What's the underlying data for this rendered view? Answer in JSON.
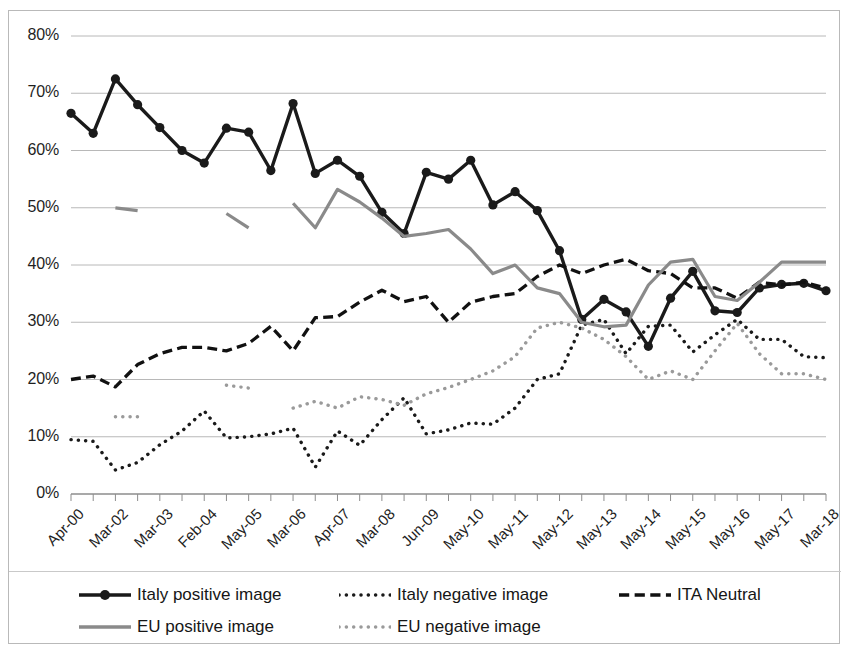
{
  "chart_data": {
    "type": "line",
    "title": "",
    "xlabel": "",
    "ylabel": "",
    "ylim": [
      0,
      80
    ],
    "yticks": [
      "0%",
      "10%",
      "20%",
      "30%",
      "40%",
      "50%",
      "60%",
      "70%",
      "80%"
    ],
    "ytick_values": [
      0,
      10,
      20,
      30,
      40,
      50,
      60,
      70,
      80
    ],
    "grid": true,
    "legend_position": "bottom",
    "categories": [
      "Apr-00",
      "Nov-00",
      "Mar-02",
      "Oct-02",
      "Mar-03",
      "Oct-03",
      "Feb-04",
      "Oct-04",
      "May-05",
      "Nov-05",
      "Mar-06",
      "Sep-06",
      "Apr-07",
      "Oct-07",
      "Mar-08",
      "Oct-08",
      "Jun-09",
      "Nov-09",
      "May-10",
      "Nov-10",
      "May-11",
      "Nov-11",
      "May-12",
      "Nov-12",
      "May-13",
      "Nov-13",
      "May-14",
      "Nov-14",
      "May-15",
      "Nov-15",
      "May-16",
      "Nov-16",
      "May-17",
      "Nov-17",
      "Mar-18"
    ],
    "xtick_labels": [
      "Apr-00",
      "Mar-02",
      "Mar-03",
      "Feb-04",
      "May-05",
      "Mar-06",
      "Apr-07",
      "Mar-08",
      "Jun-09",
      "May-10",
      "May-11",
      "May-12",
      "May-13",
      "May-14",
      "May-15",
      "May-16",
      "May-17",
      "Mar-18"
    ],
    "series": [
      {
        "name": "Italy positive image",
        "color": "#1a1a1a",
        "style": "solid",
        "markers": true,
        "values": [
          66.5,
          63.0,
          72.5,
          68.0,
          64.0,
          60.0,
          57.8,
          63.9,
          63.2,
          56.5,
          68.2,
          56.0,
          58.3,
          55.5,
          49.2,
          45.5,
          56.2,
          55.0,
          58.3,
          50.5,
          52.8,
          49.5,
          42.5,
          30.5,
          34.0,
          31.8,
          25.8,
          34.2,
          38.9,
          32.0,
          31.7,
          36.0,
          36.6,
          36.8,
          35.5
        ]
      },
      {
        "name": "Italy negative image",
        "color": "#1a1a1a",
        "style": "dotted",
        "markers": false,
        "values": [
          9.5,
          9.2,
          4.2,
          5.5,
          8.6,
          11.0,
          14.5,
          9.8,
          10.0,
          10.5,
          11.5,
          4.7,
          11.0,
          8.5,
          13.0,
          16.8,
          10.5,
          11.2,
          12.4,
          12.2,
          15.0,
          20.0,
          21.0,
          29.5,
          30.5,
          24.5,
          29.3,
          29.5,
          24.8,
          27.8,
          30.5,
          27.0,
          27.0,
          24.0,
          23.8
        ]
      },
      {
        "name": "ITA Neutral",
        "color": "#111111",
        "style": "dashed",
        "markers": false,
        "values": [
          20.0,
          20.6,
          18.7,
          22.6,
          24.5,
          25.6,
          25.6,
          25.0,
          26.3,
          29.3,
          25.0,
          30.8,
          31.0,
          33.5,
          35.6,
          33.6,
          34.5,
          30.0,
          33.5,
          34.5,
          35.0,
          38.0,
          40.0,
          38.5,
          40.0,
          41.0,
          39.0,
          38.5,
          36.0,
          36.0,
          34.2,
          37.0,
          36.5,
          37.0,
          36.0
        ]
      },
      {
        "name": "EU positive image",
        "color": "#8a8a8a",
        "style": "solid",
        "markers": false,
        "values": [
          null,
          null,
          50.0,
          49.5,
          null,
          null,
          null,
          49.0,
          46.5,
          null,
          50.8,
          46.5,
          53.2,
          51.0,
          48.2,
          45.0,
          45.5,
          46.2,
          42.8,
          38.5,
          40.0,
          36.0,
          35.0,
          30.0,
          29.2,
          29.5,
          36.5,
          40.5,
          41.0,
          34.5,
          33.8,
          37.0,
          40.5,
          40.5,
          40.5
        ]
      },
      {
        "name": "EU negative image",
        "color": "#9a9a9a",
        "style": "dotted",
        "markers": false,
        "values": [
          null,
          null,
          13.5,
          13.5,
          null,
          null,
          null,
          19.0,
          18.5,
          null,
          15.0,
          16.2,
          15.0,
          17.0,
          16.5,
          15.5,
          17.5,
          18.6,
          20.0,
          21.5,
          24.0,
          29.0,
          30.0,
          29.0,
          27.0,
          24.0,
          20.0,
          21.5,
          20.0,
          25.0,
          29.8,
          24.5,
          21.0,
          21.0,
          20.0
        ]
      }
    ]
  },
  "legend": {
    "items": [
      {
        "label": "Italy positive image",
        "key": "solid-marker-black"
      },
      {
        "label": "Italy negative image",
        "key": "dotted-black"
      },
      {
        "label": "ITA Neutral",
        "key": "dashed-black"
      },
      {
        "label": "EU positive image",
        "key": "solid-gray"
      },
      {
        "label": "EU negative image",
        "key": "dotted-gray"
      }
    ]
  }
}
